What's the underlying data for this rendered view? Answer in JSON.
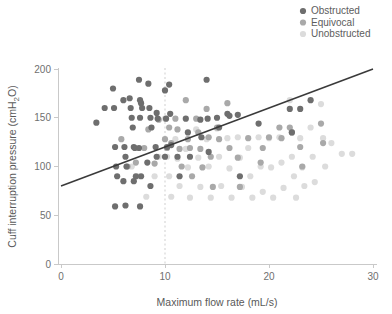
{
  "chart_data": {
    "type": "scatter",
    "title": "",
    "xlabel": "Maximum flow rate (mL/s)",
    "ylabel": "Cuff interruption pressure (cmH†2O)",
    "ylabel_text": "Cuff interruption pressure (cmH2O)",
    "ylabel_prefix": "Cuff interruption pressure (cmH",
    "ylabel_sub": "2",
    "ylabel_suffix": "O)",
    "xlim": [
      0,
      30
    ],
    "ylim": [
      0,
      200
    ],
    "xticks": [
      0,
      10,
      20,
      30
    ],
    "yticks": [
      0,
      50,
      100,
      150,
      200
    ],
    "xtick_labels": [
      "0",
      "10",
      "20",
      "30"
    ],
    "ytick_labels": [
      "0",
      "50",
      "100",
      "150",
      "200"
    ],
    "grid": false,
    "legend_position": "top-right",
    "reference_line": {
      "orientation": "vertical",
      "x": 10,
      "style": "dashed",
      "color": "#cfcfcf"
    },
    "trend_line": {
      "x0": 0,
      "y0": 80,
      "x1": 30,
      "y1": 200,
      "color": "#3a3a3a"
    },
    "series": [
      {
        "name": "Obstructed",
        "color": "#6e6e6e",
        "points": [
          [
            3.4,
            145
          ],
          [
            4.2,
            160
          ],
          [
            5.0,
            180
          ],
          [
            5.1,
            160
          ],
          [
            5.2,
            120
          ],
          [
            5.3,
            100
          ],
          [
            5.4,
            90
          ],
          [
            5.2,
            59
          ],
          [
            6.0,
            168
          ],
          [
            6.1,
            120
          ],
          [
            6.2,
            110
          ],
          [
            6.3,
            100
          ],
          [
            6.0,
            85
          ],
          [
            6.2,
            60
          ],
          [
            6.6,
            170
          ],
          [
            6.7,
            160
          ],
          [
            6.8,
            150
          ],
          [
            6.9,
            140
          ],
          [
            7.0,
            120
          ],
          [
            7.1,
            119
          ],
          [
            7.2,
            90
          ],
          [
            7.0,
            85
          ],
          [
            7.5,
            189
          ],
          [
            7.6,
            168
          ],
          [
            7.7,
            165
          ],
          [
            7.8,
            160
          ],
          [
            7.6,
            150
          ],
          [
            7.5,
            119
          ],
          [
            7.7,
            90
          ],
          [
            7.6,
            59
          ],
          [
            8.4,
            185
          ],
          [
            8.5,
            160
          ],
          [
            8.6,
            150
          ],
          [
            8.7,
            140
          ],
          [
            8.3,
            104
          ],
          [
            8.6,
            80
          ],
          [
            9.2,
            155
          ],
          [
            9.3,
            149
          ],
          [
            9.1,
            120
          ],
          [
            9.2,
            110
          ],
          [
            10.0,
            178
          ],
          [
            10.1,
            149
          ],
          [
            10.2,
            120
          ],
          [
            10.0,
            110
          ],
          [
            10.4,
            184
          ],
          [
            10.5,
            154
          ],
          [
            10.6,
            122
          ],
          [
            11.2,
            110
          ],
          [
            11.4,
            90
          ],
          [
            12.0,
            149
          ],
          [
            12.2,
            135
          ],
          [
            12.4,
            110
          ],
          [
            13.4,
            148
          ],
          [
            13.5,
            130
          ],
          [
            14.0,
            189
          ],
          [
            14.1,
            149
          ],
          [
            14.2,
            115
          ],
          [
            15.0,
            150
          ],
          [
            15.2,
            140
          ],
          [
            16.0,
            154
          ],
          [
            16.2,
            152
          ],
          [
            17.0,
            153
          ],
          [
            17.2,
            90
          ],
          [
            19.0,
            144
          ],
          [
            22.0,
            159
          ],
          [
            22.2,
            135
          ],
          [
            23.0,
            159
          ],
          [
            24.0,
            168
          ]
        ]
      },
      {
        "name": "Equivocal",
        "color": "#a9a9a9",
        "points": [
          [
            5.8,
            128
          ],
          [
            6.4,
            100
          ],
          [
            7.2,
            104
          ],
          [
            8.0,
            119
          ],
          [
            8.4,
            138
          ],
          [
            9.0,
            103
          ],
          [
            9.4,
            148
          ],
          [
            10.0,
            128
          ],
          [
            10.2,
            119
          ],
          [
            10.4,
            140
          ],
          [
            10.6,
            124
          ],
          [
            11.0,
            149
          ],
          [
            11.2,
            138
          ],
          [
            11.4,
            118
          ],
          [
            11.6,
            100
          ],
          [
            12.0,
            168
          ],
          [
            12.2,
            128
          ],
          [
            12.4,
            119
          ],
          [
            12.6,
            90
          ],
          [
            13.0,
            149
          ],
          [
            13.2,
            135
          ],
          [
            13.4,
            118
          ],
          [
            13.6,
            99
          ],
          [
            14.0,
            159
          ],
          [
            14.2,
            130
          ],
          [
            14.4,
            110
          ],
          [
            14.6,
            79
          ],
          [
            15.0,
            140
          ],
          [
            15.2,
            128
          ],
          [
            16.0,
            165
          ],
          [
            16.2,
            119
          ],
          [
            17.0,
            109
          ],
          [
            17.2,
            79
          ],
          [
            18.0,
            129
          ],
          [
            19.2,
            104
          ],
          [
            19.4,
            119
          ],
          [
            20.0,
            130
          ],
          [
            21.0,
            140
          ],
          [
            21.2,
            129
          ],
          [
            22.0,
            140
          ],
          [
            22.2,
            135
          ],
          [
            23.0,
            120
          ],
          [
            23.2,
            100
          ],
          [
            25.0,
            144
          ],
          [
            25.2,
            124
          ]
        ]
      },
      {
        "name": "Unobstructed",
        "color": "#dcdcdc",
        "points": [
          [
            6.8,
            100
          ],
          [
            7.4,
            90
          ],
          [
            8.2,
            69
          ],
          [
            9.0,
            90
          ],
          [
            9.4,
            110
          ],
          [
            10.0,
            149
          ],
          [
            10.2,
            110
          ],
          [
            10.4,
            90
          ],
          [
            10.6,
            69
          ],
          [
            11.0,
            128
          ],
          [
            11.2,
            108
          ],
          [
            11.4,
            80
          ],
          [
            12.0,
            118
          ],
          [
            12.2,
            99
          ],
          [
            12.4,
            68
          ],
          [
            13.0,
            138
          ],
          [
            13.2,
            109
          ],
          [
            13.4,
            79
          ],
          [
            14.0,
            128
          ],
          [
            14.2,
            100
          ],
          [
            14.4,
            68
          ],
          [
            15.0,
            139
          ],
          [
            15.2,
            110
          ],
          [
            15.4,
            80
          ],
          [
            16.0,
            129
          ],
          [
            16.2,
            98
          ],
          [
            16.4,
            68
          ],
          [
            17.0,
            130
          ],
          [
            17.2,
            109
          ],
          [
            17.4,
            79
          ],
          [
            18.0,
            119
          ],
          [
            18.2,
            90
          ],
          [
            18.4,
            68
          ],
          [
            19.0,
            130
          ],
          [
            19.2,
            100
          ],
          [
            19.4,
            74
          ],
          [
            20.0,
            129
          ],
          [
            20.2,
            99
          ],
          [
            20.4,
            68
          ],
          [
            21.0,
            130
          ],
          [
            21.2,
            104
          ],
          [
            21.4,
            78
          ],
          [
            22.0,
            168
          ],
          [
            22.2,
            110
          ],
          [
            22.4,
            90
          ],
          [
            22.6,
            68
          ],
          [
            23.0,
            129
          ],
          [
            23.2,
            99
          ],
          [
            23.4,
            80
          ],
          [
            24.0,
            140
          ],
          [
            24.2,
            110
          ],
          [
            24.4,
            84
          ],
          [
            25.0,
            164
          ],
          [
            25.2,
            129
          ],
          [
            25.4,
            100
          ],
          [
            26.0,
            124
          ],
          [
            27.0,
            113
          ],
          [
            28.0,
            113
          ]
        ]
      }
    ]
  },
  "legend": {
    "items": [
      {
        "label": "Obstructed",
        "color": "#6e6e6e"
      },
      {
        "label": "Equivocal",
        "color": "#a9a9a9"
      },
      {
        "label": "Unobstructed",
        "color": "#dcdcdc"
      }
    ]
  }
}
